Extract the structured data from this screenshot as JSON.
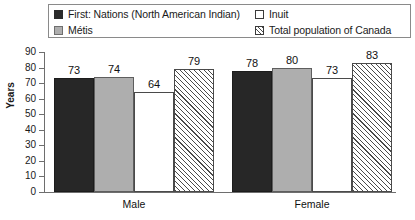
{
  "legend": {
    "entries": [
      {
        "label": "First: Nations (North American Indian)",
        "swatch": "dark-solid-swatch",
        "column": "left",
        "row": 1
      },
      {
        "label": "Métis",
        "swatch": "gray-solid-swatch",
        "column": "left",
        "row": 2
      },
      {
        "label": "Inuit",
        "swatch": "white-empty-swatch",
        "column": "right",
        "row": 1
      },
      {
        "label": "Total population of Canada",
        "swatch": "hatched-swatch",
        "column": "right",
        "row": 2
      }
    ]
  },
  "axis": {
    "ylabel": "Years",
    "yticks": [
      "90",
      "80",
      "70",
      "60",
      "50",
      "40",
      "30",
      "20",
      "10",
      "0"
    ]
  },
  "chart_data": {
    "type": "bar",
    "title": "",
    "xlabel": "",
    "ylabel": "Years",
    "ylim": [
      0,
      90
    ],
    "ytick_values": [
      0,
      10,
      20,
      30,
      40,
      50,
      60,
      70,
      80,
      90
    ],
    "grid": false,
    "legend_position": "top",
    "categories": [
      "Male",
      "Female"
    ],
    "series": [
      {
        "name": "First: Nations (North American Indian)",
        "values": [
          73,
          78
        ],
        "style": "dark-solid",
        "color": "#272727"
      },
      {
        "name": "Métis",
        "values": [
          74,
          80
        ],
        "style": "gray-solid",
        "color": "#aeaeae"
      },
      {
        "name": "Inuit",
        "values": [
          64,
          73
        ],
        "style": "white-empty",
        "color": "#ffffff"
      },
      {
        "name": "Total population of Canada",
        "values": [
          79,
          83
        ],
        "style": "hatched",
        "color": "#ffffff"
      }
    ]
  }
}
